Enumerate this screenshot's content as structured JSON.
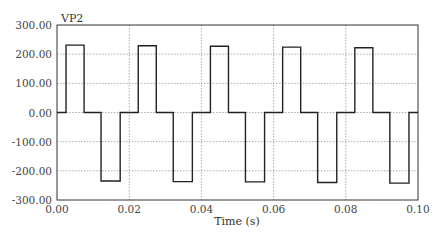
{
  "chart_data": {
    "type": "line",
    "title": "",
    "series_label": "VP2",
    "xlabel": "Time (s)",
    "ylabel": "",
    "xlim": [
      0.0,
      0.1
    ],
    "ylim": [
      -300,
      300
    ],
    "xticks": [
      0.0,
      0.02,
      0.04,
      0.06,
      0.08,
      0.1
    ],
    "xtick_labels": [
      "0.00",
      "0.02",
      "0.04",
      "0.06",
      "0.08",
      "0.10"
    ],
    "yticks": [
      300,
      200,
      100,
      0,
      -100,
      -200,
      -300
    ],
    "ytick_labels": [
      "300.00",
      "200.00",
      "100.00",
      "0.00",
      "-100.00",
      "-200.00",
      "-300.00"
    ],
    "grid": true,
    "grid_style": "dotted",
    "legend": "none",
    "series": [
      {
        "name": "VP2",
        "color": "#222222",
        "x": [
          0.0,
          0.0025,
          0.0025,
          0.0075,
          0.0075,
          0.0122,
          0.0122,
          0.0175,
          0.0175,
          0.0225,
          0.0225,
          0.0275,
          0.0275,
          0.0322,
          0.0322,
          0.0375,
          0.0375,
          0.0425,
          0.0425,
          0.0475,
          0.0475,
          0.0522,
          0.0522,
          0.0575,
          0.0575,
          0.0625,
          0.0625,
          0.0675,
          0.0675,
          0.0722,
          0.0722,
          0.0775,
          0.0775,
          0.0825,
          0.0825,
          0.0875,
          0.0875,
          0.0922,
          0.0922,
          0.0975,
          0.0975,
          0.1
        ],
        "y": [
          0,
          0,
          231,
          231,
          0,
          0,
          -235,
          -235,
          0,
          0,
          229,
          229,
          0,
          0,
          -237,
          -237,
          0,
          0,
          227,
          227,
          0,
          0,
          -238,
          -238,
          0,
          0,
          224,
          224,
          0,
          0,
          -240,
          -240,
          0,
          0,
          222,
          222,
          0,
          0,
          -242,
          -242,
          0,
          0
        ]
      }
    ]
  }
}
